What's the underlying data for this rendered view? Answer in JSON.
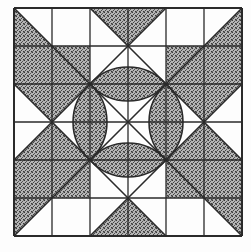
{
  "figure": {
    "title": "",
    "grid_divisions": 6,
    "origin": [
      14,
      8
    ],
    "size": 228,
    "colors": {
      "background": "#fdfdfd",
      "line": "#2a2a2a",
      "shade": "#8a8a8a",
      "white": "#f8f8f8"
    },
    "lens_radius": 51
  }
}
